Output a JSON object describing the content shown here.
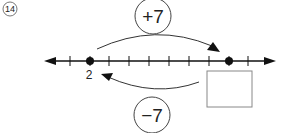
{
  "problem": {
    "number_label": "⑭",
    "number": 14
  },
  "number_line": {
    "start_point_label": "2",
    "start_value": 2,
    "end_value_blank": "",
    "tick_count": 10,
    "colors": {
      "line": "#111111",
      "circle": "#444444",
      "box": "#888888"
    }
  },
  "forward_operation": {
    "label": "+7",
    "direction": "right"
  },
  "backward_operation": {
    "label": "−7",
    "direction": "left"
  },
  "answer_box": {
    "value": ""
  }
}
